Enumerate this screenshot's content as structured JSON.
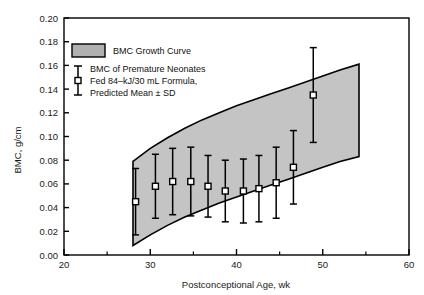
{
  "chart_data": {
    "type": "line",
    "title": "",
    "xlabel": "Postconceptional Age, wk",
    "ylabel": "BMC, g/cm",
    "xlim": [
      20,
      60
    ],
    "ylim": [
      0.0,
      0.2
    ],
    "xticks": [
      20,
      30,
      40,
      50,
      60
    ],
    "xtick_labels": [
      "20",
      "30",
      "40",
      "50",
      "60"
    ],
    "xminor_step": 5,
    "yticks": [
      0.0,
      0.02,
      0.04,
      0.06,
      0.08,
      0.1,
      0.12,
      0.14,
      0.16,
      0.18,
      0.2
    ],
    "ytick_labels": [
      "0.00",
      "0.02",
      "0.04",
      "0.06",
      "0.08",
      "0.10",
      "0.12",
      "0.14",
      "0.16",
      "0.18",
      "0.20"
    ],
    "grid": false,
    "legend_position": "upper-left",
    "series": [
      {
        "name": "BMC Growth Curve",
        "type": "band",
        "fill": "#b3b3b3",
        "x": [
          28.0,
          30.0,
          32.0,
          34.0,
          36.0,
          38.0,
          40.0,
          42.0,
          44.0,
          46.0,
          48.0,
          50.0,
          52.0,
          54.2
        ],
        "upper": [
          0.079,
          0.09,
          0.099,
          0.107,
          0.114,
          0.12,
          0.126,
          0.131,
          0.136,
          0.141,
          0.146,
          0.151,
          0.156,
          0.161
        ],
        "lower": [
          0.008,
          0.017,
          0.025,
          0.032,
          0.038,
          0.044,
          0.049,
          0.054,
          0.059,
          0.064,
          0.069,
          0.074,
          0.079,
          0.083
        ]
      },
      {
        "name": "BMC of Premature Neonates Fed 84-kJ/30 mL Formula, Predicted Mean ± SD",
        "type": "scatter-errorbar",
        "marker": "open-square",
        "x": [
          28.3,
          30.6,
          32.6,
          34.7,
          36.7,
          38.7,
          40.8,
          42.6,
          44.6,
          46.6,
          48.9
        ],
        "y": [
          0.045,
          0.058,
          0.062,
          0.062,
          0.058,
          0.054,
          0.054,
          0.056,
          0.061,
          0.074,
          0.135
        ],
        "sd": [
          0.028,
          0.027,
          0.028,
          0.029,
          0.026,
          0.026,
          0.027,
          0.028,
          0.03,
          0.031,
          0.04
        ]
      }
    ]
  },
  "legend": {
    "band_label": "BMC Growth Curve",
    "marker_label_line1": "BMC of Premature Neonates",
    "marker_label_line2": "Fed 84–kJ/30 mL Formula,",
    "marker_label_line3": "Predicted Mean ± SD"
  }
}
